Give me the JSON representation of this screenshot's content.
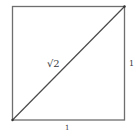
{
  "diagram": {
    "type": "unit-square-with-diagonal",
    "labels": {
      "diagonal": "√2",
      "right_side": "1",
      "bottom_side": "1"
    },
    "colors": {
      "stroke": "#6e6e6e",
      "text": "#3a3a3a",
      "background": "#ffffff"
    }
  }
}
